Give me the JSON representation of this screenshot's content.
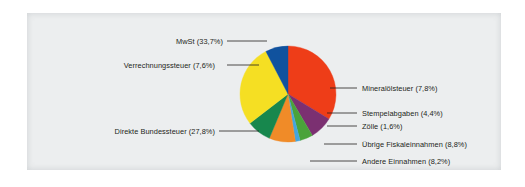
{
  "figure": {
    "background_color": "#eceeef",
    "page_background": "#ffffff"
  },
  "chart_data": {
    "type": "pie",
    "title": "",
    "subtitle": "",
    "xlabel": "",
    "ylabel": "",
    "legend_position": "callout-labels",
    "grid": false,
    "value_suffix": "%",
    "decimal_separator": ",",
    "total": 100.0,
    "start_angle_deg": 0,
    "direction": "clockwise",
    "categories": [
      "MwSt",
      "Mineralölsteuer",
      "Stempelabgaben",
      "Zölle",
      "Übrige Fiskaleinnahmen",
      "Andere Einnahmen",
      "Direkte Bundessteuer",
      "Verrechnungssteuer"
    ],
    "values": [
      33.7,
      7.8,
      4.4,
      1.6,
      8.8,
      8.2,
      27.8,
      7.6
    ],
    "colors": [
      "#ee3d18",
      "#7b3071",
      "#4aa33a",
      "#44a5dd",
      "#f08b28",
      "#17874d",
      "#f5df23",
      "#10529e"
    ],
    "slices": [
      {
        "label": "MwSt (33,7%)",
        "name": "MwSt",
        "value": 33.7,
        "color": "#ee3d18",
        "side": "left"
      },
      {
        "label": "Mineralölsteuer (7,8%)",
        "name": "Mineralölsteuer",
        "value": 7.8,
        "color": "#7b3071",
        "side": "right"
      },
      {
        "label": "Stempelabgaben (4,4%)",
        "name": "Stempelabgaben",
        "value": 4.4,
        "color": "#4aa33a",
        "side": "right"
      },
      {
        "label": "Zölle (1,6%)",
        "name": "Zölle",
        "value": 1.6,
        "color": "#44a5dd",
        "side": "right"
      },
      {
        "label": "Übrige Fiskaleinnahmen (8,8%)",
        "name": "Übrige Fiskaleinnahmen",
        "value": 8.8,
        "color": "#f08b28",
        "side": "right"
      },
      {
        "label": "Andere Einnahmen (8,2%)",
        "name": "Andere Einnahmen",
        "value": 8.2,
        "color": "#17874d",
        "side": "right"
      },
      {
        "label": "Direkte Bundessteuer (27,8%)",
        "name": "Direkte Bundessteuer",
        "value": 27.8,
        "color": "#f5df23",
        "side": "left"
      },
      {
        "label": "Verrechnungssteuer (7,6%)",
        "name": "Verrechnungssteuer",
        "value": 7.6,
        "color": "#10529e",
        "side": "left"
      }
    ]
  },
  "labels": {
    "mwst": "MwSt (33,7%)",
    "verrechnungssteuer": "Verrechnungssteuer (7,6%)",
    "direkte_bundessteuer": "Direkte Bundessteuer (27,8%)",
    "mineraloelsteuer": "Mineralölsteuer (7,8%)",
    "stempelabgaben": "Stempelabgaben (4,4%)",
    "zoelle": "Zölle (1,6%)",
    "uebrige_fiskaleinnahmen": "Übrige Fiskaleinnahmen (8,8%)",
    "andere_einnahmen": "Andere Einnahmen (8,2%)"
  }
}
